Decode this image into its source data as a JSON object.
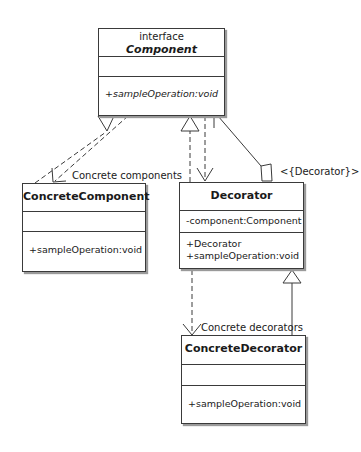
{
  "diagram": {
    "type": "UML class diagram",
    "pattern": "Decorator",
    "classes": {
      "component": {
        "stereotype": "interface",
        "name": "Component",
        "attributes": [],
        "operations": [
          "+sampleOperation:void"
        ]
      },
      "concrete_component": {
        "name": "ConcreteComponent",
        "attributes": [],
        "operations": [
          "+sampleOperation:void"
        ]
      },
      "decorator": {
        "name": "Decorator",
        "attributes": [
          "-component:Component"
        ],
        "operations": [
          "+Decorator",
          "+sampleOperation:void"
        ]
      },
      "concrete_decorator": {
        "name": "ConcreteDecorator",
        "attributes": [],
        "operations": [
          "+sampleOperation:void"
        ]
      }
    },
    "labels": {
      "concrete_components": "Concrete components",
      "decorator_role": "<{Decorator}>",
      "concrete_decorators": "Concrete decorators"
    },
    "relationships": [
      {
        "from": "ConcreteComponent",
        "to": "Component",
        "kind": "realization"
      },
      {
        "from": "Component",
        "to": "ConcreteComponent",
        "kind": "dependency",
        "label": "Concrete components"
      },
      {
        "from": "Decorator",
        "to": "Component",
        "kind": "realization"
      },
      {
        "from": "Component",
        "to": "Decorator",
        "kind": "dependency"
      },
      {
        "from": "Decorator",
        "to": "Component",
        "kind": "aggregation",
        "label": "<{Decorator}>"
      },
      {
        "from": "ConcreteDecorator",
        "to": "Decorator",
        "kind": "generalization"
      },
      {
        "from": "Decorator",
        "to": "ConcreteDecorator",
        "kind": "dependency",
        "label": "Concrete decorators"
      }
    ],
    "colors": {
      "line": "#3a3a3a",
      "background": "#ffffff",
      "shadow": "#9a9a9a"
    }
  }
}
